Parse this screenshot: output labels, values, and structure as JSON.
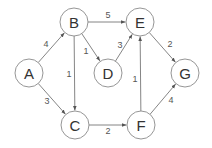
{
  "graph": {
    "type": "directed-weighted",
    "node_radius": 14,
    "colors": {
      "node_stroke": "#8a8a8a",
      "edge": "#777777",
      "text": "#333333",
      "weight_text": "#555555"
    },
    "nodes": [
      {
        "id": "A",
        "label": "A",
        "x": 29,
        "y": 73
      },
      {
        "id": "B",
        "label": "B",
        "x": 74,
        "y": 22
      },
      {
        "id": "C",
        "label": "C",
        "x": 75,
        "y": 125
      },
      {
        "id": "D",
        "label": "D",
        "x": 108,
        "y": 73
      },
      {
        "id": "E",
        "label": "E",
        "x": 140,
        "y": 22
      },
      {
        "id": "F",
        "label": "F",
        "x": 141,
        "y": 125
      },
      {
        "id": "G",
        "label": "G",
        "x": 185,
        "y": 73
      }
    ],
    "edges": [
      {
        "from": "A",
        "to": "B",
        "weight": "4",
        "lx": 46,
        "ly": 44
      },
      {
        "from": "A",
        "to": "C",
        "weight": "3",
        "lx": 47,
        "ly": 101
      },
      {
        "from": "B",
        "to": "E",
        "weight": "5",
        "lx": 108,
        "ly": 15
      },
      {
        "from": "B",
        "to": "C",
        "weight": "1",
        "lx": 69,
        "ly": 74
      },
      {
        "from": "B",
        "to": "D",
        "weight": "1",
        "lx": 86,
        "ly": 51
      },
      {
        "from": "D",
        "to": "E",
        "weight": "3",
        "lx": 120,
        "ly": 45
      },
      {
        "from": "E",
        "to": "G",
        "weight": "2",
        "lx": 170,
        "ly": 44
      },
      {
        "from": "C",
        "to": "F",
        "weight": "2",
        "lx": 108,
        "ly": 131
      },
      {
        "from": "F",
        "to": "E",
        "weight": "1",
        "lx": 135,
        "ly": 79
      },
      {
        "from": "F",
        "to": "G",
        "weight": "4",
        "lx": 171,
        "ly": 100
      }
    ]
  }
}
